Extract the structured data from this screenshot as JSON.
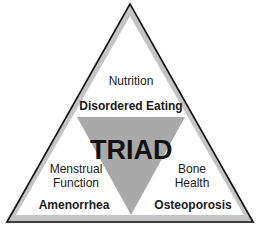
{
  "diagram": {
    "center_label": "TRIAD",
    "top": {
      "label": "Nutrition",
      "condition": "Disordered Eating"
    },
    "left": {
      "label_line1": "Menstrual",
      "label_line2": "Function",
      "condition": "Amenorrhea"
    },
    "right": {
      "label_line1": "Bone",
      "label_line2": "Health",
      "condition": "Osteoporosis"
    },
    "colors": {
      "outline": "#111111",
      "band": "#b8b8b8",
      "inner_triangle": "#a9a9a9",
      "background": "#ffffff"
    }
  }
}
